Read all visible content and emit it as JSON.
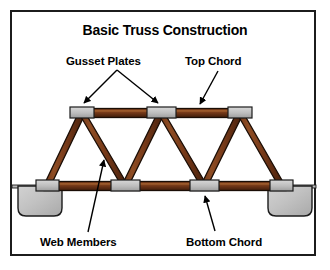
{
  "diagram": {
    "title": "Basic Truss Construction",
    "type": "truss-construction-diagram",
    "background_color": "#ffffff",
    "frame_color": "#1c1c1c"
  },
  "labels": {
    "gusset_plates": "Gusset Plates",
    "top_chord": "Top Chord",
    "web_members": "Web Members",
    "bottom_chord": "Bottom Chord"
  },
  "colors": {
    "member_fill": "#7a3c1a",
    "member_highlight": "#9c5a2c",
    "member_shadow": "#4a2410",
    "member_outline": "#1a0d05",
    "gusset_fill": "#c2c2c2",
    "gusset_outline": "#1c1c1c",
    "abutment_fill": "#c0c0c0",
    "abutment_outline": "#1c1c1c",
    "leader_color": "#000000"
  },
  "structure": {
    "top_chord_y": 113,
    "bottom_chord_y": 186,
    "top_nodes_x": [
      82,
      161,
      240
    ],
    "bottom_nodes_x": [
      47,
      125,
      204,
      282
    ],
    "gusset_count": 7,
    "web_member_count": 6,
    "abutment_count": 2
  }
}
